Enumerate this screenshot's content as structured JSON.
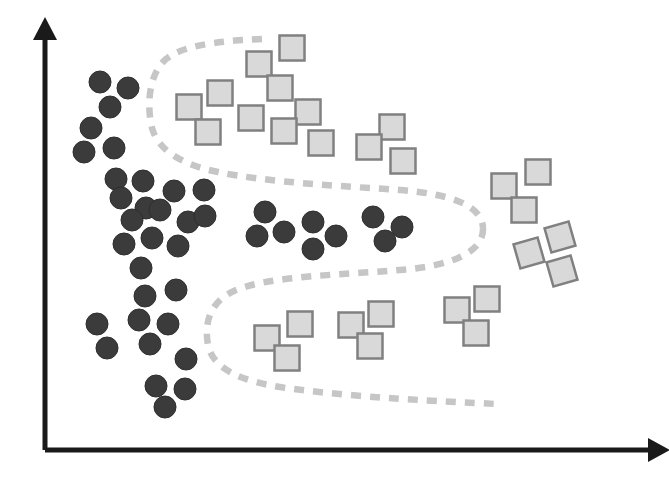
{
  "figure": {
    "title": "",
    "width": 669,
    "height": 496,
    "background_color": "#ffffff"
  },
  "axes": {
    "x_axis": {
      "label": "",
      "color": "#1a1a1a",
      "start": [
        45,
        450
      ],
      "end": [
        648,
        450
      ],
      "arrow": "right-arrow"
    },
    "y_axis": {
      "label": "",
      "color": "#1a1a1a",
      "start": [
        45,
        450
      ],
      "end": [
        45,
        24
      ],
      "arrow": "up-arrow"
    }
  },
  "chart_data": {
    "type": "scatter",
    "title": "",
    "xlabel": "",
    "ylabel": "",
    "xlim": [
      45,
      669
    ],
    "ylim": [
      0,
      450
    ],
    "grid": false,
    "legend": null,
    "annotations": [
      {
        "name": "decision-boundary",
        "kind": "dashed-curve",
        "color": "#c6c6c6",
        "dash": "10 9",
        "width": 6.5,
        "description": "Serpentine dashed decision boundary separating dark circles from light squares"
      }
    ],
    "series": [
      {
        "name": "Class A",
        "marker": "circle",
        "fill": "#3b3b3b",
        "stroke": "#2e2e2e",
        "radius": 11,
        "count": 40,
        "points": [
          [
            100,
            82
          ],
          [
            128,
            88
          ],
          [
            110,
            107
          ],
          [
            91,
            128
          ],
          [
            114,
            148
          ],
          [
            84,
            152
          ],
          [
            116,
            179
          ],
          [
            143,
            181
          ],
          [
            121,
            198
          ],
          [
            146,
            208
          ],
          [
            97,
            324
          ],
          [
            107,
            348
          ],
          [
            174,
            191
          ],
          [
            204,
            190
          ],
          [
            132,
            220
          ],
          [
            160,
            210
          ],
          [
            188,
            222
          ],
          [
            205,
            216
          ],
          [
            124,
            244
          ],
          [
            152,
            238
          ],
          [
            178,
            246
          ],
          [
            141,
            268
          ],
          [
            145,
            296
          ],
          [
            176,
            290
          ],
          [
            265,
            212
          ],
          [
            257,
            236
          ],
          [
            284,
            232
          ],
          [
            313,
            222
          ],
          [
            313,
            249
          ],
          [
            336,
            236
          ],
          [
            373,
            217
          ],
          [
            402,
            227
          ],
          [
            385,
            241
          ],
          [
            139,
            320
          ],
          [
            168,
            324
          ],
          [
            150,
            344
          ],
          [
            186,
            359
          ],
          [
            156,
            386
          ],
          [
            185,
            389
          ],
          [
            165,
            407
          ]
        ]
      },
      {
        "name": "Class B",
        "marker": "square",
        "fill": "#d9d9d9",
        "stroke": "#808080",
        "size": 25,
        "count": 28,
        "points": [
          [
            292,
            48
          ],
          [
            259,
            64
          ],
          [
            280,
            88
          ],
          [
            220,
            93
          ],
          [
            189,
            107
          ],
          [
            251,
            118
          ],
          [
            308,
            112
          ],
          [
            208,
            132
          ],
          [
            284,
            131
          ],
          [
            321,
            143
          ],
          [
            392,
            127
          ],
          [
            369,
            147
          ],
          [
            403,
            161
          ],
          [
            538,
            172
          ],
          [
            504,
            186
          ],
          [
            524,
            210
          ],
          [
            267,
            338
          ],
          [
            300,
            324
          ],
          [
            287,
            358
          ],
          [
            351,
            325
          ],
          [
            381,
            314
          ],
          [
            370,
            346
          ],
          [
            487,
            299
          ],
          [
            457,
            310
          ],
          [
            476,
            333
          ]
        ],
        "rotated_points": [
          [
            560,
            237,
            -16
          ],
          [
            529,
            253,
            -16
          ],
          [
            562,
            271,
            -16
          ]
        ]
      }
    ]
  },
  "boundary": {
    "upper_path": "M 262 39 C 215 41 178 46 163 62 C 148 78 147 108 152 128 C 158 150 182 165 218 172 C 265 182 340 186 400 190 C 450 194 482 205 483 228",
    "lower_path": "M 483 228 C 484 252 452 266 400 270 C 340 275 270 276 236 290 C 210 301 204 322 208 345 C 213 368 238 381 286 388 C 360 398 440 401 496 404"
  }
}
